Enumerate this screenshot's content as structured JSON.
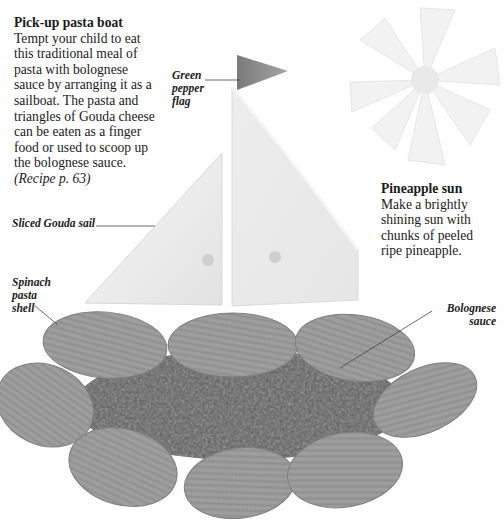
{
  "intro": {
    "title": "Pick-up pasta boat",
    "lines": [
      "Tempt your child to eat",
      "this traditional meal of",
      "pasta with bolognese",
      "sauce by arranging it as a",
      "sailboat. The pasta and",
      "triangles of Gouda cheese",
      "can be eaten as a finger",
      "food or used to scoop up",
      "the bolognese sauce."
    ],
    "recipe_ref": "(Recipe p. 63)"
  },
  "sidebar": {
    "title": "Pineapple sun",
    "lines": [
      "Make a brightly",
      "shining sun with",
      "chunks of peeled",
      "ripe pineapple."
    ]
  },
  "labels": {
    "flag": [
      "Green",
      "pepper",
      "flag"
    ],
    "sail": "Sliced Gouda sail",
    "shell": [
      "Spinach",
      "pasta",
      "shell"
    ],
    "sauce": [
      "Bolognese",
      "sauce"
    ]
  },
  "colors": {
    "background": "#ffffff",
    "flag": "#8a8a8a",
    "cheese": "#ececec",
    "pineapple": "#f1f1f1",
    "pasta": "#9a9a9a",
    "sauce": "#5e5e5e"
  }
}
